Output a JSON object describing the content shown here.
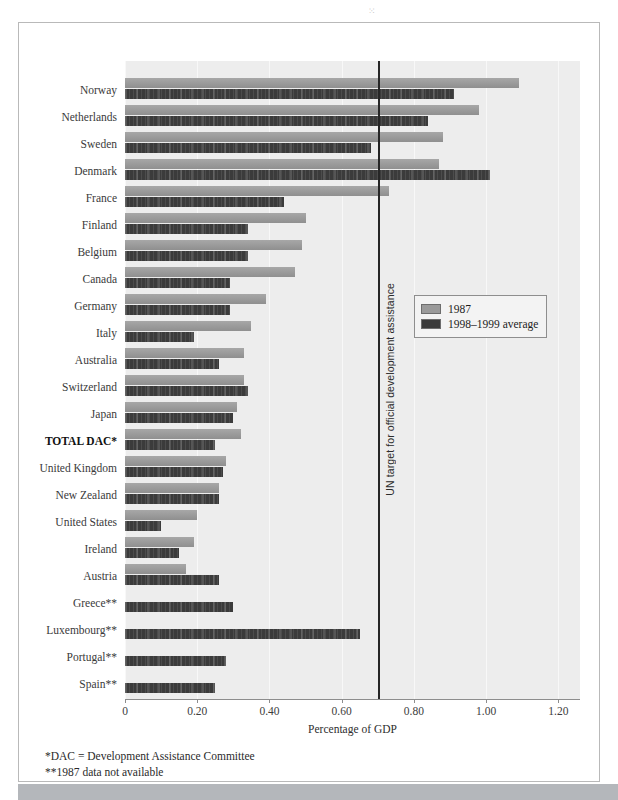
{
  "chart_data": {
    "type": "bar",
    "orientation": "horizontal",
    "title": "",
    "xlabel": "Percentage of GDP",
    "ylabel": "",
    "xlim": [
      0,
      1.26
    ],
    "xticks": [
      0,
      0.2,
      0.4,
      0.6,
      0.8,
      1.0,
      1.2
    ],
    "xticklabels": [
      "0",
      "0.20",
      "0.40",
      "0.60",
      "0.80",
      "1.00",
      "1.20"
    ],
    "grid": true,
    "legend_position": "right-upper",
    "categories": [
      "Norway",
      "Netherlands",
      "Sweden",
      "Denmark",
      "France",
      "Finland",
      "Belgium",
      "Canada",
      "Germany",
      "Italy",
      "Australia",
      "Switzerland",
      "Japan",
      "TOTAL DAC*",
      "United Kingdom",
      "New Zealand",
      "United States",
      "Ireland",
      "Austria",
      "Greece**",
      "Luxembourg**",
      "Portugal**",
      "Spain**"
    ],
    "series": [
      {
        "name": "1987",
        "color": "#9a9a9a",
        "values": [
          1.09,
          0.98,
          0.88,
          0.87,
          0.73,
          0.5,
          0.49,
          0.47,
          0.39,
          0.35,
          0.33,
          0.33,
          0.31,
          0.32,
          0.28,
          0.26,
          0.2,
          0.19,
          0.17,
          null,
          null,
          null,
          null
        ]
      },
      {
        "name": "1998–1999 average",
        "color": "#3b3b3b",
        "values": [
          0.91,
          0.84,
          0.68,
          1.01,
          0.44,
          0.34,
          0.34,
          0.29,
          0.29,
          0.19,
          0.26,
          0.34,
          0.3,
          0.25,
          0.27,
          0.26,
          0.1,
          0.15,
          0.26,
          0.3,
          0.65,
          0.28,
          0.25
        ]
      }
    ],
    "reference_line": {
      "value": 0.7,
      "label": "UN target for official development assistance",
      "color": "#262626"
    }
  },
  "legend": {
    "items": [
      {
        "label": "1987",
        "color": "#9a9a9a"
      },
      {
        "label": "1998–1999 average",
        "color": "#3b3b3b"
      }
    ]
  },
  "footnotes": {
    "dac": "*DAC = Development Assistance Committee",
    "nodata": "**1987 data not available"
  }
}
